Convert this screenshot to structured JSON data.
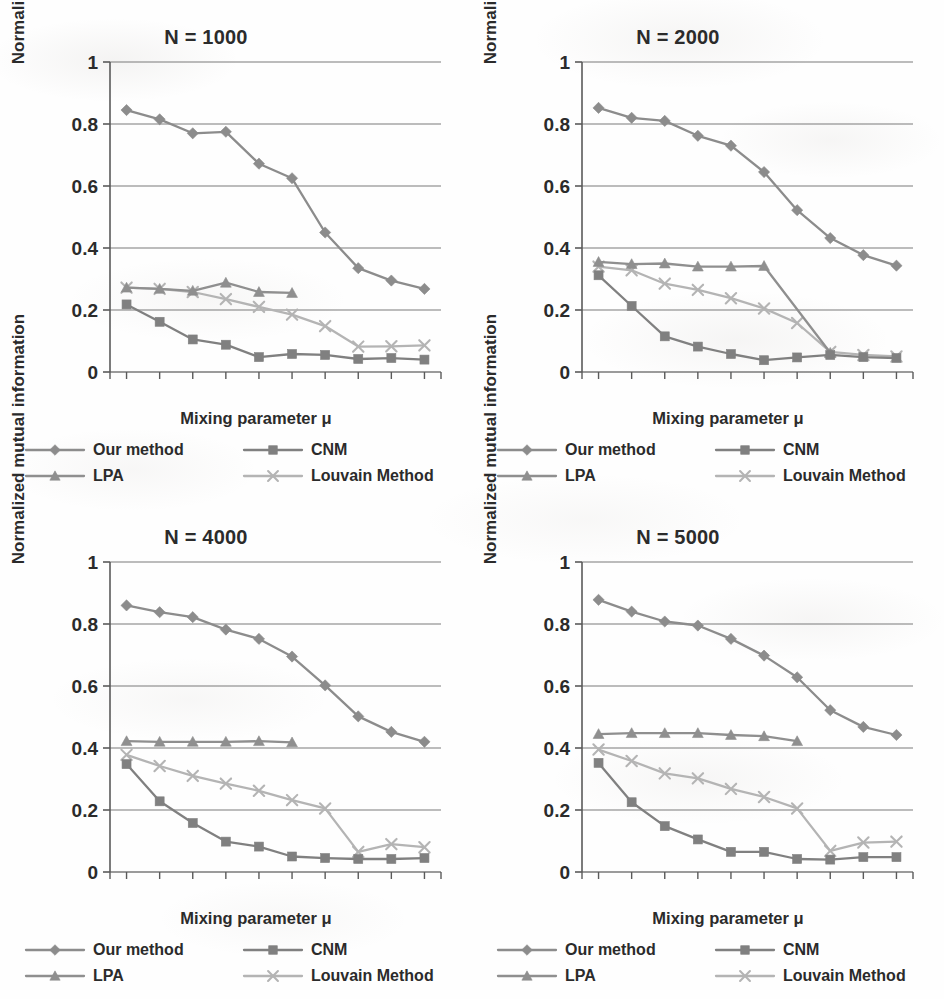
{
  "figure": {
    "panel_count": 4,
    "axis_label_x": "Mixing parameter μ",
    "axis_label_y": "Normalized mutual information"
  },
  "legend": {
    "items": [
      {
        "label": "Our method",
        "marker": "diamond",
        "color": "#8c8c8c"
      },
      {
        "label": "CNM",
        "marker": "square",
        "color": "#808080"
      },
      {
        "label": "LPA",
        "marker": "triangle",
        "color": "#8f8f8f"
      },
      {
        "label": "Louvain Method",
        "marker": "cross",
        "color": "#b4b4b4"
      }
    ]
  },
  "panels": [
    {
      "title": "N = 1000",
      "chart_index": 0
    },
    {
      "title": "N = 2000",
      "chart_index": 1
    },
    {
      "title": "N = 4000",
      "chart_index": 2
    },
    {
      "title": "N = 5000",
      "chart_index": 3
    }
  ],
  "chart_data": [
    {
      "type": "line",
      "title": "N = 1000",
      "xlabel": "Mixing parameter μ",
      "ylabel": "Normalized mutual information",
      "x": [
        0.1,
        0.2,
        0.3,
        0.4,
        0.5,
        0.6,
        0.7,
        0.8,
        0.9,
        1.0
      ],
      "xticklabels": [
        "0.1",
        "0.2",
        "0.3",
        "0.4",
        "0.5",
        "0.6",
        "0.7",
        "0.8",
        "0.9",
        "1"
      ],
      "yticklabels": [
        "0",
        "0.2",
        "0.4",
        "0.6",
        "0.8",
        "1"
      ],
      "xlim": [
        0.05,
        1.05
      ],
      "ylim": [
        0,
        1
      ],
      "grid": "horizontal",
      "legend_position": "below",
      "series": [
        {
          "name": "Our method",
          "marker": "diamond",
          "color": "#8c8c8c",
          "values": [
            0.845,
            0.815,
            0.77,
            0.775,
            0.672,
            0.625,
            0.45,
            0.335,
            0.295,
            0.268
          ]
        },
        {
          "name": "CNM",
          "marker": "square",
          "color": "#808080",
          "values": [
            0.218,
            0.162,
            0.105,
            0.088,
            0.048,
            0.058,
            0.055,
            0.042,
            0.045,
            0.04
          ]
        },
        {
          "name": "LPA",
          "marker": "triangle",
          "color": "#8f8f8f",
          "values": [
            0.272,
            0.268,
            0.262,
            0.288,
            0.258,
            0.255,
            null,
            null,
            null,
            null
          ]
        },
        {
          "name": "Louvain Method",
          "marker": "cross",
          "color": "#b4b4b4",
          "values": [
            0.272,
            0.268,
            0.258,
            0.235,
            0.21,
            0.185,
            0.148,
            0.082,
            0.083,
            0.086
          ]
        }
      ]
    },
    {
      "type": "line",
      "title": "N = 2000",
      "xlabel": "Mixing parameter μ",
      "ylabel": "Normalized mutual information",
      "x": [
        0.1,
        0.2,
        0.3,
        0.4,
        0.5,
        0.6,
        0.7,
        0.8,
        0.9,
        1.0
      ],
      "xticklabels": [
        "0.1",
        "0.2",
        "0.3",
        "0.4",
        "0.5",
        "0.6",
        "0.7",
        "0.8",
        "0.9",
        "1"
      ],
      "yticklabels": [
        "0",
        "0.2",
        "0.4",
        "0.6",
        "0.8",
        "1"
      ],
      "xlim": [
        0.05,
        1.05
      ],
      "ylim": [
        0,
        1
      ],
      "grid": "horizontal",
      "legend_position": "below",
      "series": [
        {
          "name": "Our method",
          "marker": "diamond",
          "color": "#8c8c8c",
          "values": [
            0.852,
            0.82,
            0.81,
            0.762,
            0.73,
            0.645,
            0.522,
            0.432,
            0.377,
            0.343
          ]
        },
        {
          "name": "CNM",
          "marker": "square",
          "color": "#808080",
          "values": [
            0.312,
            0.213,
            0.115,
            0.082,
            0.058,
            0.038,
            0.047,
            0.055,
            0.048,
            0.045
          ]
        },
        {
          "name": "LPA",
          "marker": "triangle",
          "color": "#8f8f8f",
          "values": [
            0.355,
            0.348,
            0.35,
            0.34,
            0.34,
            0.342,
            null,
            0.062,
            null,
            null
          ]
        },
        {
          "name": "Louvain Method",
          "marker": "cross",
          "color": "#b4b4b4",
          "values": [
            0.34,
            0.328,
            0.285,
            0.265,
            0.238,
            0.205,
            0.158,
            0.065,
            0.055,
            0.05
          ]
        }
      ]
    },
    {
      "type": "line",
      "title": "N = 4000",
      "xlabel": "Mixing parameter μ",
      "ylabel": "Normalized mutual information",
      "x": [
        0.1,
        0.2,
        0.3,
        0.4,
        0.5,
        0.6,
        0.7,
        0.8,
        0.9,
        1.0
      ],
      "xticklabels": [
        "0.1",
        "0.2",
        "0.3",
        "0.4",
        "0.5",
        "0.6",
        "0.7",
        "0.8",
        "0.9",
        "1"
      ],
      "yticklabels": [
        "0",
        "0.2",
        "0.4",
        "0.6",
        "0.8",
        "1"
      ],
      "xlim": [
        0.05,
        1.05
      ],
      "ylim": [
        0,
        1
      ],
      "grid": "horizontal",
      "legend_position": "below",
      "series": [
        {
          "name": "Our method",
          "marker": "diamond",
          "color": "#8c8c8c",
          "values": [
            0.86,
            0.838,
            0.822,
            0.782,
            0.752,
            0.695,
            0.602,
            0.502,
            0.452,
            0.42
          ]
        },
        {
          "name": "CNM",
          "marker": "square",
          "color": "#808080",
          "values": [
            0.348,
            0.228,
            0.158,
            0.098,
            0.082,
            0.05,
            0.045,
            0.042,
            0.042,
            0.045
          ]
        },
        {
          "name": "LPA",
          "marker": "triangle",
          "color": "#8f8f8f",
          "values": [
            0.422,
            0.42,
            0.42,
            0.42,
            0.422,
            0.418,
            null,
            null,
            null,
            null
          ]
        },
        {
          "name": "Louvain Method",
          "marker": "cross",
          "color": "#b4b4b4",
          "values": [
            0.378,
            0.342,
            0.31,
            0.285,
            0.262,
            0.232,
            0.205,
            0.065,
            0.09,
            0.08
          ]
        }
      ]
    },
    {
      "type": "line",
      "title": "N = 5000",
      "xlabel": "Mixing parameter μ",
      "ylabel": "Normalized mutual information",
      "x": [
        0.1,
        0.2,
        0.3,
        0.4,
        0.5,
        0.6,
        0.7,
        0.8,
        0.9,
        1.0
      ],
      "xticklabels": [
        "0.1",
        "0.2",
        "0.3",
        "0.4",
        "0.5",
        "0.6",
        "0.7",
        "0.8",
        "0.9",
        "1"
      ],
      "yticklabels": [
        "0",
        "0.2",
        "0.4",
        "0.6",
        "0.8",
        "1"
      ],
      "xlim": [
        0.05,
        1.05
      ],
      "ylim": [
        0,
        1
      ],
      "grid": "horizontal",
      "legend_position": "below",
      "series": [
        {
          "name": "Our method",
          "marker": "diamond",
          "color": "#8c8c8c",
          "values": [
            0.878,
            0.84,
            0.808,
            0.795,
            0.752,
            0.698,
            0.628,
            0.522,
            0.468,
            0.442
          ]
        },
        {
          "name": "CNM",
          "marker": "square",
          "color": "#808080",
          "values": [
            0.352,
            0.225,
            0.148,
            0.105,
            0.065,
            0.065,
            0.042,
            0.04,
            0.048,
            0.048
          ]
        },
        {
          "name": "LPA",
          "marker": "triangle",
          "color": "#8f8f8f",
          "values": [
            0.445,
            0.448,
            0.448,
            0.448,
            0.442,
            0.438,
            0.422,
            null,
            null,
            null
          ]
        },
        {
          "name": "Louvain Method",
          "marker": "cross",
          "color": "#b4b4b4",
          "values": [
            0.395,
            0.358,
            0.318,
            0.302,
            0.268,
            0.242,
            0.205,
            0.068,
            0.095,
            0.098
          ]
        }
      ]
    }
  ]
}
